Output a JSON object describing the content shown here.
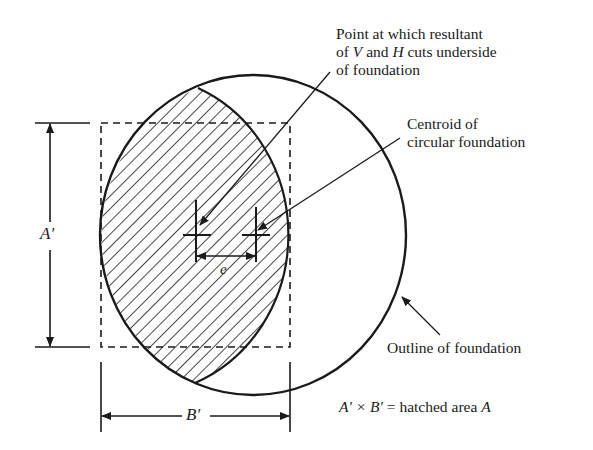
{
  "diagram": {
    "annotations": {
      "resultant_point": {
        "line1": "Point at which resultant",
        "line2_prefix": "of ",
        "line2_V": "V",
        "line2_mid": " and ",
        "line2_H": "H",
        "line2_suffix": " cuts underside",
        "line3": "of foundation"
      },
      "centroid": {
        "line1": "Centroid of",
        "line2": "circular foundation"
      },
      "outline": "Outline of foundation",
      "equation": {
        "lhs": "A′ × B′",
        "eq": " = hatched area ",
        "rhs": "A"
      }
    },
    "dimensions": {
      "height_label": "A′",
      "width_label": "B′",
      "eccentricity_label": "e"
    },
    "colors": {
      "stroke": "#1a1a1a",
      "background": "#ffffff"
    }
  }
}
